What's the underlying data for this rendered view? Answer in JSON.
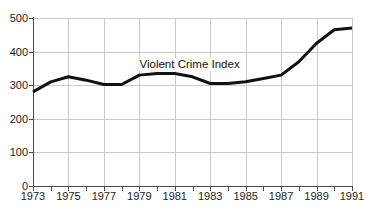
{
  "header": {
    "clipped_title": "wwww"
  },
  "chart_data": {
    "type": "line",
    "title": "",
    "xlabel": "",
    "ylabel": "",
    "xlim": [
      1973,
      1991
    ],
    "ylim": [
      0,
      500
    ],
    "grid": true,
    "legend_position": "inline-annotation",
    "annotations": [
      {
        "text": "Violent Crime Index",
        "x": 1982,
        "y": 360
      }
    ],
    "ytick_labels": [
      "0",
      "100",
      "200",
      "300",
      "400",
      "500"
    ],
    "ytick_values": [
      0,
      100,
      200,
      300,
      400,
      500
    ],
    "xtick_labels": [
      "1973",
      "1975",
      "1977",
      "1979",
      "1981",
      "1983",
      "1985",
      "1987",
      "1989",
      "1991"
    ],
    "xtick_values": [
      1973,
      1975,
      1977,
      1979,
      1981,
      1983,
      1985,
      1987,
      1989,
      1991
    ],
    "minor_xticks": [
      1973,
      1974,
      1975,
      1976,
      1977,
      1978,
      1979,
      1980,
      1981,
      1982,
      1983,
      1984,
      1985,
      1986,
      1987,
      1988,
      1989,
      1990,
      1991
    ],
    "series": [
      {
        "name": "Violent Crime Index",
        "color": "#111111",
        "x": [
          1973,
          1974,
          1975,
          1976,
          1977,
          1978,
          1979,
          1980,
          1981,
          1982,
          1983,
          1984,
          1985,
          1986,
          1987,
          1988,
          1989,
          1990,
          1991
        ],
        "values": [
          280,
          310,
          325,
          315,
          302,
          302,
          330,
          335,
          335,
          325,
          305,
          305,
          310,
          320,
          330,
          370,
          425,
          465,
          470
        ]
      }
    ]
  }
}
